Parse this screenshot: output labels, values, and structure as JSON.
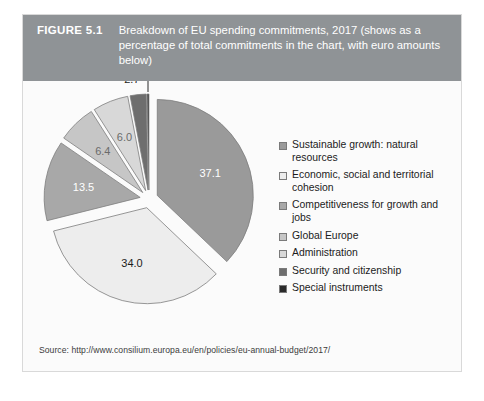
{
  "figure": {
    "number": "FIGURE 5.1",
    "caption": "Breakdown of EU spending commitments, 2017 (shows as a percentage of total commitments in the chart, with euro amounts below)",
    "header_bg": "#8f9396",
    "header_text_color": "#ffffff",
    "card_bg": "#fbfbfb",
    "card_border": "#d9d9d9"
  },
  "source": {
    "text": "Source: http://www.consilium.europa.eu/en/policies/eu-annual-budget/2017/"
  },
  "legend": {
    "items": [
      {
        "label": "Sustainable growth: natural resources",
        "color": "#9a9a9a"
      },
      {
        "label": "Economic, social and territorial cohesion",
        "color": "#ededed"
      },
      {
        "label": "Competitiveness for growth and jobs",
        "color": "#a8a8a8"
      },
      {
        "label": "Global Europe",
        "color": "#c6c6c6"
      },
      {
        "label": "Administration",
        "color": "#d8d8d8"
      },
      {
        "label": "Security and citizenship",
        "color": "#6e6e6e"
      },
      {
        "label": "Special instruments",
        "color": "#2a2a2a"
      }
    ]
  },
  "chart_data": {
    "type": "pie",
    "title": "Breakdown of EU spending commitments, 2017",
    "xlabel": "",
    "ylabel": "",
    "units": "percentage of total commitments",
    "exploded": true,
    "legend_position": "right",
    "grid": false,
    "labels": [
      "Sustainable growth: natural resources",
      "Economic, social and territorial cohesion",
      "Competitiveness for growth and jobs",
      "Global Europe",
      "Administration",
      "Security and citizenship",
      "Special instruments"
    ],
    "values": [
      37.1,
      34.0,
      13.5,
      6.4,
      6.0,
      2.7,
      0.3
    ],
    "value_labels": [
      "37.1",
      "34.0",
      "13.5",
      "6.4",
      "6.0",
      "2.7",
      "0.3"
    ],
    "colors": [
      "#9a9a9a",
      "#ededed",
      "#a8a8a8",
      "#c6c6c6",
      "#d8d8d8",
      "#6e6e6e",
      "#2a2a2a"
    ],
    "label_text_colors": [
      "#ffffff",
      "#1c1c1c",
      "#ffffff",
      "#6b6b6b",
      "#6b6b6b",
      "#1c1c1c",
      "#1c1c1c"
    ],
    "callout_slices": [
      "2.7",
      "0.3"
    ]
  }
}
